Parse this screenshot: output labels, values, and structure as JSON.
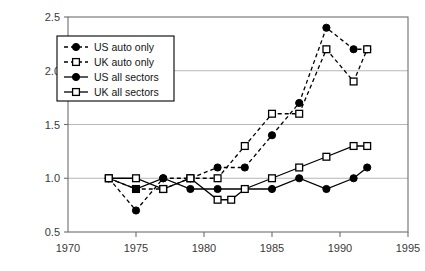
{
  "chart_data": {
    "type": "line",
    "title": "",
    "subtitle": "",
    "xlabel": "",
    "ylabel": "",
    "xlim": [
      1970,
      1995
    ],
    "ylim": [
      0.5,
      2.5
    ],
    "xticks": [
      1970,
      1975,
      1980,
      1985,
      1990,
      1995
    ],
    "xtick_labels": [
      "1970",
      "1975",
      "1980",
      "1985",
      "1990",
      "1995"
    ],
    "yticks": [
      0.5,
      1.0,
      1.5,
      2.0,
      2.5
    ],
    "ytick_labels": [
      "0.5",
      "1.0",
      "1.5",
      "2.0",
      "2.5"
    ],
    "grid": "horizontal",
    "legend_position": "upper-left-inside",
    "series": [
      {
        "name": "US auto only",
        "marker": "filled-circle",
        "line_style": "dashed",
        "color": "#000000",
        "x": [
          1973,
          1975,
          1977,
          1979,
          1981,
          1983,
          1985,
          1987,
          1989,
          1991,
          1992
        ],
        "values": [
          1.0,
          0.7,
          1.0,
          1.0,
          1.1,
          1.1,
          1.4,
          1.7,
          2.4,
          2.2,
          2.2
        ]
      },
      {
        "name": "UK auto only",
        "marker": "open-square",
        "line_style": "dashed",
        "color": "#000000",
        "x": [
          1973,
          1975,
          1977,
          1979,
          1981,
          1983,
          1985,
          1987,
          1989,
          1991,
          1992
        ],
        "values": [
          1.0,
          0.9,
          0.9,
          1.0,
          1.0,
          1.3,
          1.6,
          1.6,
          2.2,
          1.9,
          2.2
        ]
      },
      {
        "name": "US all sectors",
        "marker": "filled-circle",
        "line_style": "solid",
        "color": "#000000",
        "x": [
          1973,
          1975,
          1977,
          1979,
          1981,
          1983,
          1985,
          1987,
          1989,
          1991,
          1992
        ],
        "values": [
          1.0,
          0.9,
          1.0,
          0.9,
          0.9,
          0.9,
          0.9,
          1.0,
          0.9,
          1.0,
          1.1
        ]
      },
      {
        "name": "UK all sectors",
        "marker": "open-square",
        "line_style": "solid",
        "color": "#000000",
        "x": [
          1973,
          1975,
          1977,
          1979,
          1981,
          1982,
          1983,
          1985,
          1987,
          1989,
          1991,
          1992
        ],
        "values": [
          1.0,
          1.0,
          0.9,
          1.0,
          0.8,
          0.8,
          0.9,
          1.0,
          1.1,
          1.2,
          1.3,
          1.3
        ]
      }
    ]
  },
  "legend": {
    "items": [
      {
        "label": "US auto only"
      },
      {
        "label": "UK auto only"
      },
      {
        "label": "US all sectors"
      },
      {
        "label": "UK all sectors"
      }
    ]
  },
  "colors": {
    "ink": "#000000",
    "grid": "#b7b7b7",
    "frame": "#6e6e6e",
    "tick_text": "#3a3a3a",
    "background": "#ffffff"
  }
}
